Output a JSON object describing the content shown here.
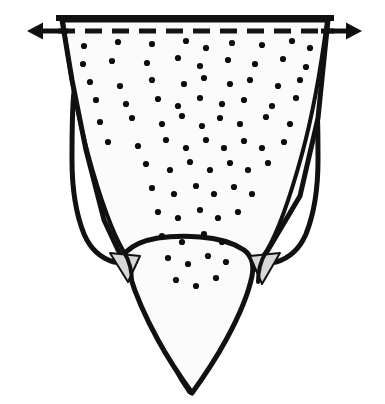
{
  "figure": {
    "title": "Stippled tapering form with lateral lobes and dimension arrows",
    "kind": "line-art-diagram",
    "width": 385,
    "height": 404,
    "background_color": "#ffffff"
  },
  "style": {
    "outline_color": "#111111",
    "outline_width_main": 5.0,
    "outline_width_inner": 4.0,
    "fill_body": "#fbfbfb",
    "fill_lobe": "#ffffff",
    "fill_wedge": "#d8d8d8",
    "dot_color": "#0d0d0d",
    "dash_color": "#141414",
    "arrow_color": "#101010"
  },
  "top_edge": {
    "name": "top-border-line",
    "x_start": 59,
    "x_end": 331,
    "y": 18,
    "stroke_width": 6
  },
  "dashed_line": {
    "name": "fold-dashed-line",
    "y": 31,
    "x_start": 58,
    "x_end": 334,
    "stroke_width": 5,
    "dash_pattern": "17 10"
  },
  "arrows": {
    "left": {
      "label": "left-dimension-arrow",
      "tail_x": 68,
      "tip_x": 27,
      "y": 31,
      "head_length": 16,
      "head_width": 17
    },
    "right": {
      "label": "right-dimension-arrow",
      "tail_x": 321,
      "tip_x": 362,
      "y": 31,
      "head_length": 16,
      "head_width": 17
    }
  },
  "shapes": {
    "body": {
      "name": "central-tapering-body",
      "path": "M 62 20 L 328 20 L 318 118 L 300 196 L 268 250 L 252 272 L 236 306 L 213 352 L 195 384 L 190 392 L 182 380 L 160 340 L 144 302 L 132 272 L 118 250 L 104 220 L 86 150 L 72 80 Z"
    },
    "body_lower": {
      "name": "central-lower-lobe",
      "path": "M 126 252 C 134 244 146 240 158 238 C 172 236 186 236 200 237 C 216 238 232 242 244 250 C 252 256 254 266 252 276 C 248 296 238 318 226 340 C 214 362 200 382 192 393 C 184 382 170 362 158 340 C 146 318 136 296 130 276 C 126 266 122 258 126 252 Z"
    },
    "left_lobe": {
      "name": "left-lateral-lobe",
      "path": "M 74 92 C 78 108 84 128 92 150 C 102 178 114 206 126 228 C 134 242 140 250 140 256 C 134 262 124 264 114 262 C 100 258 90 248 84 234 C 76 214 72 188 72 160 C 72 132 72 108 74 92 Z"
    },
    "right_lobe": {
      "name": "right-lateral-lobe",
      "path": "M 316 92 C 312 108 306 128 298 150 C 288 178 276 206 264 228 C 256 242 250 250 250 256 C 256 262 266 264 276 262 C 290 258 300 248 306 234 C 314 214 318 188 318 160 C 318 132 318 108 316 92 Z"
    },
    "left_wedge": {
      "name": "left-gray-wedge",
      "path": "M 110 253 L 140 256 L 128 282 Z"
    },
    "right_wedge": {
      "name": "right-gray-wedge",
      "path": "M 280 253 L 250 256 L 262 284 Z"
    },
    "left_inner_line": {
      "name": "left-inner-crease",
      "path": "M 63 21 C 68 60 76 110 88 154 C 100 198 112 232 124 252 C 130 262 132 272 132 282"
    },
    "right_inner_line": {
      "name": "right-inner-crease",
      "path": "M 327 21 C 322 60 314 110 302 154 C 290 198 278 232 266 252 C 260 262 258 272 258 282"
    }
  },
  "stipple": {
    "name": "stipple-dot-field",
    "radius": 3.1,
    "count": 84,
    "dots": [
      [
        84,
        46
      ],
      [
        118,
        42
      ],
      [
        152,
        44
      ],
      [
        186,
        41
      ],
      [
        206,
        48
      ],
      [
        232,
        43
      ],
      [
        262,
        45
      ],
      [
        292,
        41
      ],
      [
        310,
        48
      ],
      [
        83,
        64
      ],
      [
        112,
        61
      ],
      [
        147,
        63
      ],
      [
        178,
        58
      ],
      [
        200,
        66
      ],
      [
        228,
        60
      ],
      [
        255,
        64
      ],
      [
        283,
        59
      ],
      [
        306,
        67
      ],
      [
        90,
        82
      ],
      [
        120,
        86
      ],
      [
        152,
        80
      ],
      [
        184,
        84
      ],
      [
        204,
        78
      ],
      [
        230,
        84
      ],
      [
        250,
        80
      ],
      [
        278,
        86
      ],
      [
        300,
        80
      ],
      [
        96,
        100
      ],
      [
        126,
        104
      ],
      [
        158,
        99
      ],
      [
        178,
        106
      ],
      [
        200,
        98
      ],
      [
        222,
        104
      ],
      [
        244,
        100
      ],
      [
        272,
        106
      ],
      [
        296,
        98
      ],
      [
        100,
        122
      ],
      [
        132,
        118
      ],
      [
        162,
        124
      ],
      [
        182,
        116
      ],
      [
        202,
        126
      ],
      [
        220,
        118
      ],
      [
        240,
        124
      ],
      [
        266,
        117
      ],
      [
        290,
        124
      ],
      [
        108,
        142
      ],
      [
        138,
        146
      ],
      [
        166,
        140
      ],
      [
        186,
        148
      ],
      [
        206,
        140
      ],
      [
        224,
        148
      ],
      [
        244,
        141
      ],
      [
        262,
        148
      ],
      [
        284,
        142
      ],
      [
        146,
        164
      ],
      [
        170,
        170
      ],
      [
        190,
        162
      ],
      [
        210,
        170
      ],
      [
        230,
        163
      ],
      [
        248,
        170
      ],
      [
        268,
        163
      ],
      [
        152,
        188
      ],
      [
        174,
        194
      ],
      [
        196,
        186
      ],
      [
        214,
        194
      ],
      [
        234,
        187
      ],
      [
        252,
        194
      ],
      [
        158,
        212
      ],
      [
        178,
        218
      ],
      [
        200,
        210
      ],
      [
        218,
        218
      ],
      [
        238,
        212
      ],
      [
        162,
        236
      ],
      [
        182,
        242
      ],
      [
        204,
        234
      ],
      [
        222,
        242
      ],
      [
        168,
        258
      ],
      [
        188,
        264
      ],
      [
        208,
        256
      ],
      [
        226,
        262
      ],
      [
        176,
        280
      ],
      [
        196,
        286
      ],
      [
        216,
        278
      ]
    ]
  },
  "annotations": {
    "no_text_labels": "This figure contains no alphanumeric text labels."
  }
}
